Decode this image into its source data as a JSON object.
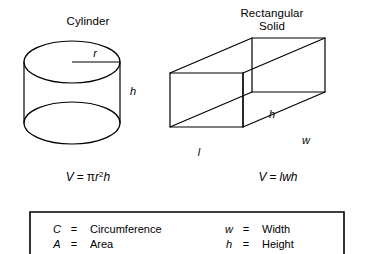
{
  "figures": [
    {
      "id": "cylinder",
      "title": "Cylinder",
      "labels": {
        "radius": "r",
        "height": "h"
      },
      "formula": {
        "lhs": "V",
        "eq": "=",
        "rhs_pi": "π",
        "rhs_r": "r",
        "rhs_exp": "2",
        "rhs_h": "h",
        "plain": "V = πr2h"
      }
    },
    {
      "id": "rectangular-solid",
      "title_line1": "Rectangular",
      "title_line2": "Solid",
      "labels": {
        "height": "h",
        "length": "l",
        "width": "w"
      },
      "formula": {
        "lhs": "V",
        "eq": "=",
        "rhs": "lwh",
        "plain": "V = lwh"
      }
    }
  ],
  "legend": {
    "entries": [
      {
        "symbol": "C",
        "equals": "=",
        "word": "Circumference",
        "column": "left"
      },
      {
        "symbol": "A",
        "equals": "=",
        "word": "Area",
        "column": "left"
      },
      {
        "symbol": "w",
        "equals": "=",
        "word": "Width",
        "column": "right"
      },
      {
        "symbol": "h",
        "equals": "=",
        "word": "Height",
        "column": "right"
      }
    ]
  },
  "style": {
    "ink": "#000000",
    "paper": "#ffffff"
  }
}
